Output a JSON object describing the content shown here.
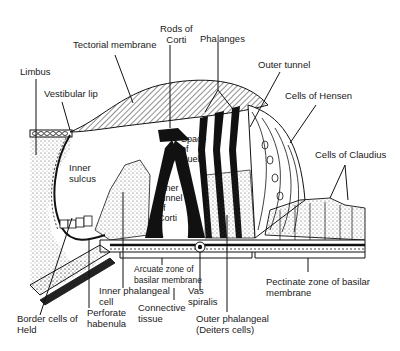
{
  "diagram": {
    "labels": {
      "tectorial_membrane": "Tectorial membrane",
      "rods_of_corti": "Rods of\nCorti",
      "phalanges": "Phalanges",
      "outer_tunnel": "Outer tunnel",
      "limbus": "Limbus",
      "vestibular_lip": "Vestibular lip",
      "cells_of_hensen": "Cells of Hensen",
      "space_of_nuel": "Space\nof\nNuel",
      "cells_of_claudius": "Cells of Claudius",
      "inner_sulcus": "Inner\nsulcus",
      "inner_tunnel_of_corti": "Inner\ntunnel\nof\nCorti",
      "arcuate_zone": "Arcuate zone of\nbasilar membrane",
      "inner_phalangeal_cell": "Inner phalangeal\ncell",
      "vas_spiralis": "Vas\nspiralis",
      "pectinate_zone": "Pectinate zone of basilar\nmembrane",
      "connective_tissue": "Connective\ntissue",
      "perforate_habenula": "Perforate\nhabenula",
      "border_cells_of_held": "Border cells of\nHeld",
      "outer_phalangeal": "Outer phalangeal\n(Deiters cells)"
    }
  }
}
